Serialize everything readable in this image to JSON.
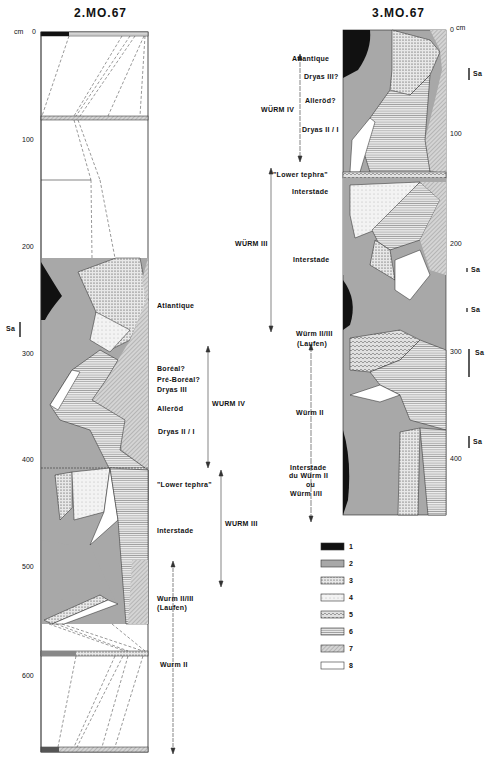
{
  "figure": {
    "left_profile": {
      "title": "2.MO.67",
      "depth_unit": "cm",
      "ticks": [
        "0",
        "100",
        "200",
        "300",
        "400",
        "500",
        "600"
      ],
      "sa_marker": "Sa",
      "stage_labels": [
        "Atlantique",
        "Boréal?",
        "Pré-Boréal?",
        "Dryas III",
        "Alleröd",
        "Dryas II / I",
        "\"Lower tephra\"",
        "Interstade",
        "Wurm II/III",
        "(Laufen)",
        "Wurm II"
      ],
      "phases": [
        "WURM IV",
        "WURM III"
      ]
    },
    "right_profile": {
      "title": "3.MO.67",
      "depth_unit": "cm",
      "ticks": [
        "0",
        "100",
        "200",
        "300",
        "400"
      ],
      "sa_markers": [
        "Sa",
        "Sa",
        "Sa",
        "Sa",
        "Sa"
      ],
      "stage_labels": [
        "Atlantique",
        "Dryas III?",
        "Alleröd?",
        "Dryas II / I",
        "\"Lower tephra\"",
        "Interstade",
        "Interstade",
        "Würm II/III",
        "(Laufen)",
        "Würm II",
        "Interstade",
        "du Würm II",
        "ou",
        "Würm I/II"
      ],
      "phases": [
        "WÜRM IV",
        "WÜRM III"
      ]
    },
    "legend": [
      {
        "num": "1",
        "pattern": "solid black"
      },
      {
        "num": "2",
        "pattern": "grey"
      },
      {
        "num": "3",
        "pattern": "dense stipple"
      },
      {
        "num": "4",
        "pattern": "light stipple"
      },
      {
        "num": "5",
        "pattern": "cross-hatch"
      },
      {
        "num": "6",
        "pattern": "horizontal lines"
      },
      {
        "num": "7",
        "pattern": "diagonal hatch"
      },
      {
        "num": "8",
        "pattern": "white"
      }
    ]
  },
  "colors": {
    "black": "#111111",
    "grey": "#a8a8a8",
    "light": "#e6e6e6",
    "hatch": "#c8c8c8"
  }
}
